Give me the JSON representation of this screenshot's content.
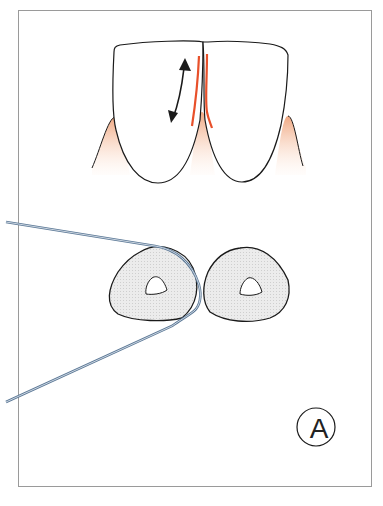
{
  "figure": {
    "label": "A",
    "colors": {
      "outline": "#1a1a1a",
      "gum": "#f2b99a",
      "floss_sides": "#e8502a",
      "floss_thread": "#5b7896",
      "cross_section_fill": "#e6e6e6",
      "frame": "#9a9a9a"
    },
    "parts": {
      "upper_view": "two-front-teeth-with-floss-and-motion-arrow",
      "lower_view": "two-tooth-cross-sections-with-floss-wrapped-around-left-tooth"
    }
  }
}
